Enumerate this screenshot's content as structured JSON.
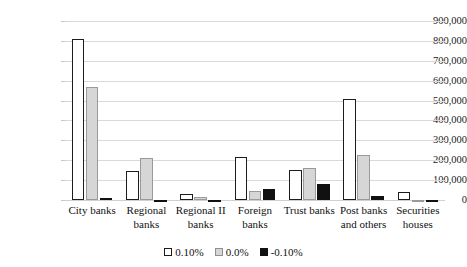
{
  "chart_data": {
    "type": "bar",
    "title": "",
    "subtitle": "",
    "xlabel": "",
    "ylabel": "",
    "ylim": [
      0,
      900000
    ],
    "ytick_step": 100000,
    "grid": true,
    "legend_position": "bottom",
    "categories": [
      "City banks",
      "Regional banks",
      "Regional II banks",
      "Foreign banks",
      "Trust banks",
      "Post banks and others",
      "Securities houses"
    ],
    "ytick_labels": [
      "900,000",
      "800,000",
      "700,000",
      "600,000",
      "500,000",
      "400,000",
      "300,000",
      "200,000",
      "100,000",
      "0"
    ],
    "ytick_values": [
      900000,
      800000,
      700000,
      600000,
      500000,
      400000,
      300000,
      200000,
      100000,
      0
    ],
    "series": [
      {
        "name": "0.10%",
        "color": "#ffffff",
        "edge_color": "#1c1c1c",
        "values": [
          808000,
          144000,
          30000,
          215000,
          152000,
          506000,
          40000
        ]
      },
      {
        "name": "0.0%",
        "color": "#d6d6d6",
        "edge_color": "#9a9a9a",
        "values": [
          570000,
          212000,
          17000,
          43000,
          160000,
          228000,
          -4000
        ]
      },
      {
        "name": "-0.10%",
        "color": "#111111",
        "edge_color": "#111111",
        "values": [
          0,
          -3000,
          -5000,
          55000,
          80000,
          18000,
          -10000
        ]
      }
    ],
    "legend": [
      {
        "label": "0.10%",
        "swatch": "s0"
      },
      {
        "label": "0.0%",
        "swatch": "s1"
      },
      {
        "label": "-0.10%",
        "swatch": "s2"
      }
    ]
  }
}
